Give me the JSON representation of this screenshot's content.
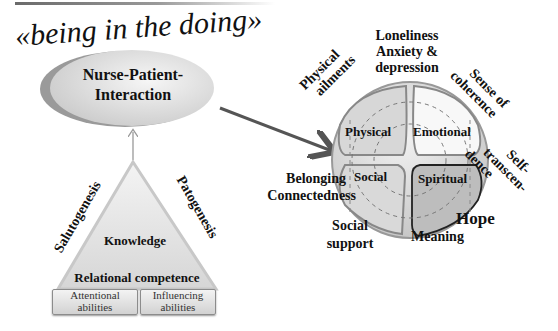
{
  "title_phrase": "«being in the doing»",
  "interaction": {
    "line1": "Nurse-Patient-",
    "line2": "Interaction"
  },
  "triangle": {
    "center": "Knowledge",
    "left_side": "Salutogenesis",
    "right_side": "Patogenesis",
    "base": "Relational competence",
    "boxes": [
      {
        "line1": "Attentional",
        "line2": "abilities"
      },
      {
        "line1": "Influencing",
        "line2": "abilities"
      }
    ]
  },
  "sphere": {
    "quadrants": [
      "Physical",
      "Emotional",
      "Social",
      "Spiritual"
    ]
  },
  "outer_labels": {
    "top": [
      "Loneliness",
      "Anxiety &",
      "depression"
    ],
    "physical_ailments": [
      "Physical",
      "ailments"
    ],
    "sense_of_coherence": [
      "Sense of",
      "coherence"
    ],
    "self_transcendence": [
      "Self-",
      "transcen-",
      "dence"
    ],
    "belonging": [
      "Belonging",
      "Connectedness"
    ],
    "social_support": [
      "Social",
      "support"
    ],
    "hope": "Hope",
    "meaning": "Meaning"
  },
  "colors": {
    "arrow": "#555555",
    "frame": "#8a8a8a",
    "spiritual_border": "#222222"
  }
}
